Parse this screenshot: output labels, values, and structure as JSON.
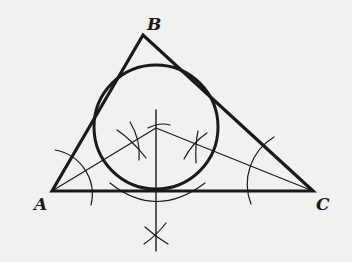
{
  "diagram": {
    "colors": {
      "background": "#f1f1f0",
      "ink": "#1a1a1a"
    },
    "vertices": [
      {
        "id": "A",
        "label": "A",
        "x": 52,
        "y": 191,
        "label_x": 34,
        "label_y": 194
      },
      {
        "id": "B",
        "label": "B",
        "x": 143,
        "y": 35,
        "label_x": 147,
        "label_y": 14
      },
      {
        "id": "C",
        "label": "C",
        "x": 313,
        "y": 191,
        "label_x": 316,
        "label_y": 194
      }
    ],
    "incircle": {
      "cx": 156,
      "cy": 127,
      "r": 62
    },
    "incenter": {
      "x": 156,
      "y": 128
    }
  }
}
